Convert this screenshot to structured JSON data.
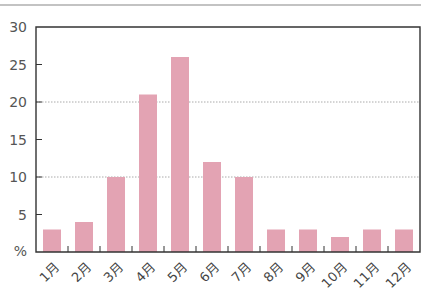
{
  "chart_data": {
    "type": "bar",
    "title": "",
    "xlabel": "",
    "ylabel": "%",
    "categories": [
      "1月",
      "2月",
      "3月",
      "4月",
      "5月",
      "6月",
      "7月",
      "8月",
      "9月",
      "10月",
      "11月",
      "12月"
    ],
    "values": [
      3,
      4,
      10,
      21,
      26,
      12,
      10,
      3,
      3,
      2,
      3,
      3
    ],
    "ylim": [
      0,
      30
    ],
    "yticks": [
      5,
      10,
      15,
      20,
      25,
      30
    ],
    "ytick_labels": [
      "5",
      "10",
      "15",
      "20",
      "25",
      "30"
    ],
    "y_unit_label": "%",
    "gridlines": [
      10,
      20
    ],
    "grid": "dotted at 10 and 20",
    "legend": "none",
    "colors": {
      "bar": "#e3a3b3",
      "axis": "#333333",
      "grid": "#aaaaaa",
      "rule": "#777777"
    }
  }
}
